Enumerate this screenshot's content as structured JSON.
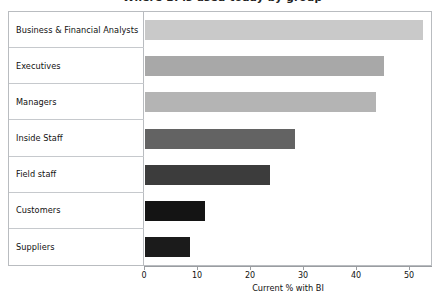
{
  "title_remnant": "Where BI is used today by group",
  "chart_data": {
    "type": "bar",
    "orientation": "horizontal",
    "title": "",
    "xlabel": "Current % with BI",
    "ylabel": "",
    "xlim": [
      0,
      55
    ],
    "xticks": [
      0,
      10,
      20,
      30,
      40,
      50
    ],
    "grid": false,
    "legend": "none",
    "categories": [
      "Business & Financial Analysts",
      "Executives",
      "Managers",
      "Inside Staff",
      "Field staff",
      "Customers",
      "Suppliers"
    ],
    "values": [
      52.5,
      45.0,
      43.5,
      28.3,
      23.6,
      11.3,
      8.5
    ],
    "bar_colors": [
      "#c9c9c9",
      "#a8a8a8",
      "#b4b4b4",
      "#636363",
      "#3c3c3c",
      "#141414",
      "#1b1b1b"
    ]
  },
  "style": {
    "frame_color": "#b9bcc0",
    "row_divider_color": "#c6c9cd",
    "axis_color": "#9a9da1",
    "text_color": "#111111"
  }
}
